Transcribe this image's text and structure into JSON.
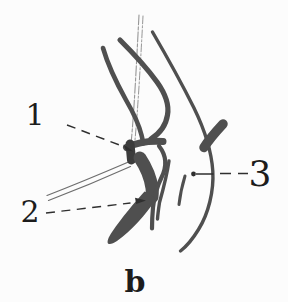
{
  "figure": {
    "caption": {
      "text": "b"
    },
    "labels": {
      "l1": "1",
      "l2": "2",
      "l3": "3"
    },
    "colors": {
      "background": "#fcfcfc",
      "stroke_gray": "#4f4f4f",
      "stroke_dark": "#3c3c3c",
      "thin_gray": "#8c8c8c",
      "sketch_gray": "#6e6e6e",
      "leader_black": "#2f2f2f",
      "text_black": "#1c1c1c"
    }
  }
}
